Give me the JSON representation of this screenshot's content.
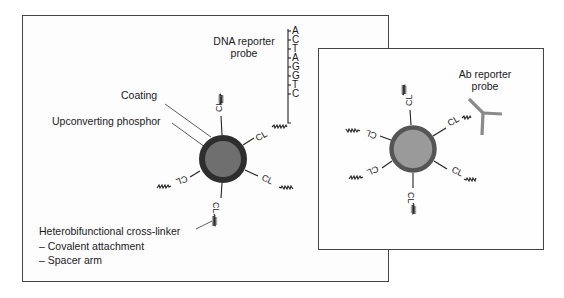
{
  "left_panel": {
    "title": "DNA-conjugated upconverting phosphor particle",
    "labels": {
      "dna_probe_line1": "DNA reporter",
      "dna_probe_line2": "probe",
      "coating": "Coating",
      "phosphor": "Upconverting phosphor",
      "crosslinker": "Heterobifunctional cross-linker",
      "bullet1": "–  Covalent attachment",
      "bullet2": "–  Spacer arm"
    },
    "dna_sequence": [
      "A",
      "C",
      "T",
      "A",
      "G",
      "G",
      "T",
      "C"
    ],
    "linker_label": "CL",
    "colors": {
      "core": "#6f6f6f",
      "coating": "#2e2e2e"
    }
  },
  "right_panel": {
    "labels": {
      "ab_probe_line1": "Ab reporter",
      "ab_probe_line2": "probe"
    },
    "linker_label": "CL",
    "colors": {
      "core": "#9a9a9a",
      "coating": "#555555",
      "antibody": "#8a8a8a"
    }
  }
}
